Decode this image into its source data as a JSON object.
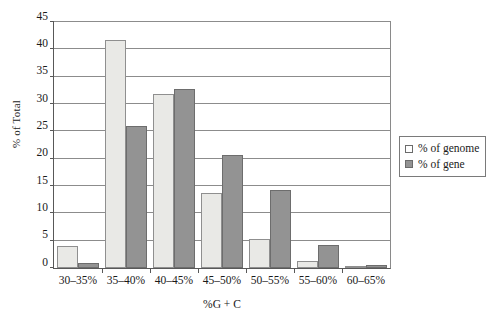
{
  "chart_data": {
    "type": "bar",
    "title": "",
    "xlabel": "%G + C",
    "ylabel": "% of Total",
    "categories": [
      "30–35%",
      "35–40%",
      "40–45%",
      "45–50%",
      "50–55%",
      "55–60%",
      "60–65%"
    ],
    "series": [
      {
        "name": "% of genome",
        "values": [
          4.0,
          41.8,
          31.8,
          13.8,
          5.3,
          1.2,
          0.2
        ],
        "color": "#e9e9e6"
      },
      {
        "name": "% of gene",
        "values": [
          1.0,
          25.9,
          32.8,
          20.7,
          14.2,
          4.3,
          0.6
        ],
        "color": "#939393"
      }
    ],
    "ylim": [
      0,
      45
    ],
    "yticks": [
      0,
      5,
      10,
      15,
      20,
      25,
      30,
      35,
      40,
      45
    ],
    "ytick_labels": [
      "0",
      "5",
      "10",
      "15",
      "20",
      "25",
      "30",
      "35",
      "40",
      "45"
    ],
    "grid": true,
    "legend_position": "right"
  },
  "legend": {
    "items": [
      {
        "label": "% of genome",
        "swatch": "genome"
      },
      {
        "label": "% of gene",
        "swatch": "gene"
      }
    ]
  }
}
